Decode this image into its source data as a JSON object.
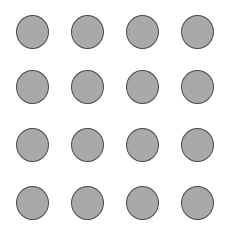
{
  "caption": "·",
  "grid": {
    "rows": 4,
    "cols": 4,
    "col_x": [
      16,
      71,
      126,
      181
    ],
    "row_y": [
      15,
      70,
      128,
      186
    ],
    "fill": "#a9a9a9",
    "stroke": "#4a4a4a",
    "items": [
      {
        "row": 0,
        "col": 0
      },
      {
        "row": 0,
        "col": 1
      },
      {
        "row": 0,
        "col": 2
      },
      {
        "row": 0,
        "col": 3
      },
      {
        "row": 1,
        "col": 0
      },
      {
        "row": 1,
        "col": 1
      },
      {
        "row": 1,
        "col": 2
      },
      {
        "row": 1,
        "col": 3
      },
      {
        "row": 2,
        "col": 0
      },
      {
        "row": 2,
        "col": 1
      },
      {
        "row": 2,
        "col": 2
      },
      {
        "row": 2,
        "col": 3
      },
      {
        "row": 3,
        "col": 0
      },
      {
        "row": 3,
        "col": 1
      },
      {
        "row": 3,
        "col": 2
      },
      {
        "row": 3,
        "col": 3
      }
    ]
  }
}
